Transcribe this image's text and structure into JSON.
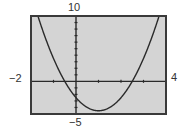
{
  "window": {
    "ymax_label": "10",
    "ymin_label": "−5",
    "xmin_label": "−2",
    "xmax_label": "4"
  },
  "colors": {
    "screen_bg": "#d4d4d4",
    "frame": "#3a3a3a",
    "curve": "#2a2a2a",
    "axis": "#2a2a2a"
  },
  "chart_data": {
    "type": "line",
    "title": "",
    "xlabel": "",
    "ylabel": "",
    "xlim": [
      -2,
      4
    ],
    "ylim": [
      -5,
      10
    ],
    "xscale": 1,
    "yscale": 1,
    "grid": false,
    "annotations": [
      "10",
      "−5",
      "−2",
      "4"
    ],
    "series": [
      {
        "name": "parabola",
        "equation_estimate": "y = 2x^2 - 4x - 2.5",
        "x": [
          -1.75,
          -1.5,
          -1.0,
          -0.5,
          0,
          0.5,
          1.0,
          1.5,
          2.0,
          2.5,
          3.0,
          3.5,
          3.75
        ],
        "y": [
          10.6,
          7.5,
          3.5,
          0,
          -2.5,
          -4.0,
          -4.5,
          -4.0,
          -2.5,
          0,
          3.5,
          7.5,
          10.6
        ]
      }
    ],
    "x_intercepts": [
      -0.5,
      2.5
    ],
    "y_intercept": -2.5,
    "vertex": [
      1,
      -4.5
    ]
  }
}
